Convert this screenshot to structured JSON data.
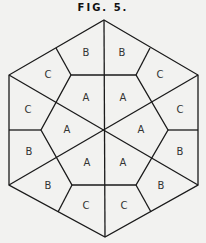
{
  "figure": {
    "title": "FIG. 5.",
    "labels": {
      "b_top_left": "B",
      "b_top_right": "B",
      "c_upper_left": "C",
      "c_upper_right": "C",
      "a_top_left": "A",
      "a_top_right": "A",
      "c_left": "C",
      "c_right": "C",
      "a_left": "A",
      "a_right": "A",
      "b_left": "B",
      "b_right": "B",
      "a_bottom_left": "A",
      "a_bottom_right": "A",
      "b_lower_left": "B",
      "b_lower_right": "B",
      "c_bottom_left": "C",
      "c_bottom_right": "C"
    }
  }
}
